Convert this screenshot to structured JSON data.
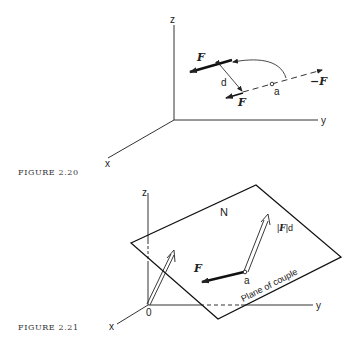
{
  "figures": [
    {
      "caption": "FIGURE 2.20",
      "axes": {
        "x": "x",
        "y": "y",
        "z": "z"
      },
      "labels": {
        "force_top": "F",
        "force_bottom": "F",
        "force_negative": "−F",
        "distance": "d",
        "point": "a"
      }
    },
    {
      "caption": "FIGURE 2.21",
      "axes": {
        "x": "x",
        "y": "y",
        "z": "z",
        "origin": "0"
      },
      "labels": {
        "plane_name": "N",
        "moment": "|F|d",
        "moment_bar_left": "|",
        "moment_F": "F",
        "moment_bar_right": "|d",
        "force": "F",
        "point": "a",
        "plane_caption": "Plane of couple"
      }
    }
  ],
  "colors": {
    "ink": "#222222",
    "background": "#ffffff"
  }
}
